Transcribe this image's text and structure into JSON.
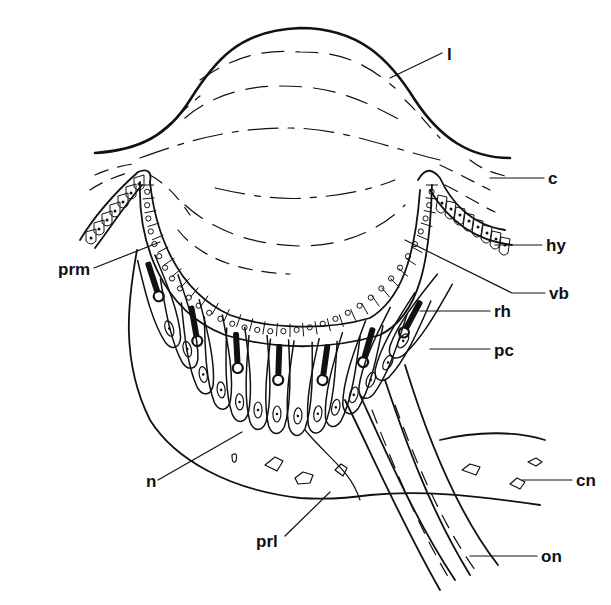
{
  "figure": {
    "ink_color": "#111111",
    "background_color": "#ffffff"
  },
  "labels": {
    "lens": "l",
    "cuticle": "c",
    "hypodermis": "hy",
    "vitreous_body": "vb",
    "rhabdom": "rh",
    "pigment_cell": "pc",
    "connective_tissue_nuclei": "cn",
    "optic_nerve": "on",
    "preretinal_membrane": "prm",
    "nucleus": "n",
    "postretinal_layer": "prl"
  }
}
